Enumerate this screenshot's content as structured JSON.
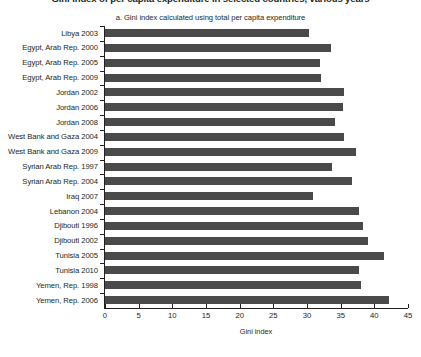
{
  "clipped_heading": "Gini index of per capita expenditure in selected countries, various years",
  "chart_data": {
    "type": "bar",
    "orientation": "horizontal",
    "title": "a. Gini index calculated using total per capita expenditure",
    "xlabel": "Gini index",
    "ylabel": "",
    "xlim": [
      0,
      45
    ],
    "xticks": [
      0,
      5,
      10,
      15,
      20,
      25,
      30,
      35,
      40,
      45
    ],
    "grid": false,
    "legend": "none",
    "bar_color": "#4a4a4a",
    "categories": [
      "Libya 2003",
      "Egypt, Arab Rep. 2000",
      "Egypt, Arab Rep. 2005",
      "Egypt, Arab Rep. 2009",
      "Jordan 2002",
      "Jordan 2006",
      "Jordan 2008",
      "West Bank and Gaza 2004",
      "West Bank and Gaza 2009",
      "Syrian Arab Rep. 1997",
      "Syrian Arab Rep. 2004",
      "Iraq 2007",
      "Lebanon 2004",
      "Djibouti 1996",
      "Djibouti 2002",
      "Tunisia 2005",
      "Tunisia 2010",
      "Yemen, Rep. 1998",
      "Yemen, Rep. 2006"
    ],
    "values": [
      30.3,
      33.5,
      32.0,
      32.1,
      35.5,
      35.4,
      34.1,
      35.5,
      37.3,
      33.7,
      36.7,
      30.9,
      37.7,
      38.3,
      39.0,
      41.4,
      37.7,
      38.0,
      42.2
    ]
  }
}
